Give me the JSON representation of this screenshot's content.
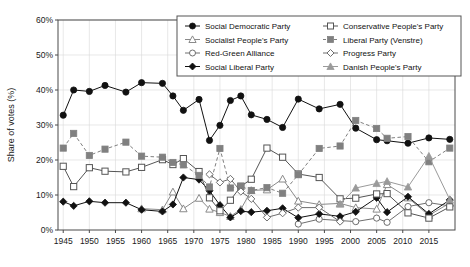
{
  "chart_data": {
    "type": "line",
    "title": "",
    "xlabel": "",
    "ylabel": "Share of votes (%)",
    "xlim": [
      1944,
      2020
    ],
    "ylim": [
      0,
      60
    ],
    "ytick_labels": [
      "0%",
      "10%",
      "20%",
      "30%",
      "40%",
      "50%",
      "60%"
    ],
    "ytick_values": [
      0,
      10,
      20,
      30,
      40,
      50,
      60
    ],
    "xtick_labels": [
      "1945",
      "1950",
      "1955",
      "1960",
      "1965",
      "1970",
      "1975",
      "1980",
      "1985",
      "1990",
      "1995",
      "2000",
      "2005",
      "2010",
      "2015"
    ],
    "xtick_values": [
      1945,
      1950,
      1955,
      1960,
      1965,
      1970,
      1975,
      1980,
      1985,
      1990,
      1995,
      2000,
      2005,
      2010,
      2015
    ],
    "grid": true,
    "legend_position": "top-right",
    "election_years": [
      1945,
      1947,
      1950,
      1953,
      1957,
      1960,
      1964,
      1966,
      1968,
      1971,
      1973,
      1975,
      1977,
      1979,
      1981,
      1984,
      1987,
      1990,
      1994,
      1998,
      2001,
      2005,
      2007,
      2011,
      2015,
      2019
    ],
    "series": [
      {
        "name": "Social Democratic Party",
        "marker": "filled-circle",
        "color": "#111111",
        "linestyle": "solid",
        "x": [
          1945,
          1947,
          1950,
          1953,
          1957,
          1960,
          1964,
          1966,
          1968,
          1971,
          1973,
          1975,
          1977,
          1979,
          1981,
          1984,
          1987,
          1990,
          1994,
          1998,
          2001,
          2005,
          2007,
          2011,
          2015,
          2019
        ],
        "values": [
          32.8,
          40.0,
          39.6,
          41.3,
          39.4,
          42.1,
          41.9,
          38.3,
          34.2,
          37.3,
          25.6,
          29.9,
          37.0,
          38.3,
          32.9,
          31.6,
          29.3,
          37.4,
          34.6,
          35.9,
          29.1,
          25.8,
          25.5,
          24.8,
          26.3,
          25.9
        ]
      },
      {
        "name": "Socialist People's Party",
        "marker": "open-triangle",
        "color": "#8a8a8a",
        "linestyle": "solid",
        "x": [
          1960,
          1964,
          1966,
          1968,
          1971,
          1973,
          1975,
          1977,
          1979,
          1981,
          1984,
          1987,
          1990,
          1994,
          1998,
          2001,
          2005,
          2007,
          2011,
          2015,
          2019
        ],
        "values": [
          6.1,
          5.8,
          10.9,
          6.1,
          9.1,
          6.0,
          5.0,
          3.9,
          5.9,
          11.3,
          11.5,
          14.6,
          8.3,
          7.3,
          7.6,
          6.4,
          6.0,
          13.0,
          9.2,
          4.2,
          7.7
        ]
      },
      {
        "name": "Red-Green Alliance",
        "marker": "open-circle",
        "color": "#6e6e6e",
        "linestyle": "solid",
        "x": [
          1990,
          1994,
          1998,
          2001,
          2005,
          2007,
          2011,
          2015,
          2019
        ],
        "values": [
          1.7,
          3.1,
          2.7,
          2.4,
          3.4,
          2.2,
          6.7,
          7.8,
          6.9
        ]
      },
      {
        "name": "Social Liberal Party",
        "marker": "filled-diamond",
        "color": "#111111",
        "linestyle": "solid",
        "x": [
          1945,
          1947,
          1950,
          1953,
          1957,
          1960,
          1964,
          1966,
          1968,
          1971,
          1973,
          1975,
          1977,
          1979,
          1981,
          1984,
          1987,
          1990,
          1994,
          1998,
          2001,
          2005,
          2007,
          2011,
          2015,
          2019
        ],
        "values": [
          8.1,
          6.9,
          8.2,
          7.8,
          7.8,
          5.8,
          5.3,
          7.3,
          15.0,
          14.4,
          11.2,
          7.1,
          3.6,
          5.4,
          5.1,
          5.5,
          6.2,
          3.5,
          4.6,
          3.9,
          5.2,
          9.2,
          5.1,
          9.5,
          4.6,
          8.6
        ]
      },
      {
        "name": "Conservative People's Party",
        "marker": "open-square",
        "color": "#555555",
        "linestyle": "solid",
        "x": [
          1945,
          1947,
          1950,
          1953,
          1957,
          1960,
          1964,
          1966,
          1968,
          1971,
          1973,
          1975,
          1977,
          1979,
          1981,
          1984,
          1987,
          1990,
          1994,
          1998,
          2001,
          2005,
          2007,
          2011,
          2015,
          2019
        ],
        "values": [
          18.2,
          12.4,
          17.8,
          16.8,
          16.6,
          17.9,
          20.1,
          18.7,
          20.4,
          16.7,
          9.2,
          5.5,
          8.5,
          12.5,
          14.5,
          23.4,
          20.8,
          16.0,
          15.0,
          8.9,
          9.1,
          10.3,
          10.4,
          4.9,
          3.4,
          6.6
        ]
      },
      {
        "name": "Liberal Party (Venstre)",
        "marker": "filled-square",
        "color": "#808080",
        "linestyle": "dashed",
        "x": [
          1945,
          1947,
          1950,
          1953,
          1957,
          1960,
          1964,
          1966,
          1968,
          1971,
          1973,
          1975,
          1977,
          1979,
          1981,
          1984,
          1987,
          1990,
          1994,
          1998,
          2001,
          2005,
          2007,
          2011,
          2015,
          2019
        ],
        "values": [
          23.4,
          27.6,
          21.3,
          23.1,
          25.1,
          21.1,
          20.8,
          19.3,
          18.6,
          15.6,
          12.3,
          23.3,
          12.0,
          12.5,
          11.3,
          12.1,
          10.5,
          15.8,
          23.3,
          24.0,
          31.3,
          29.0,
          26.2,
          26.7,
          19.5,
          23.4
        ]
      },
      {
        "name": "Progress Party",
        "marker": "open-diamond",
        "color": "#6e6e6e",
        "linestyle": "solid",
        "x": [
          1973,
          1975,
          1977,
          1979,
          1981,
          1984,
          1987,
          1990,
          1994,
          1998
        ],
        "values": [
          15.9,
          13.6,
          14.6,
          11.0,
          8.9,
          3.6,
          4.8,
          6.4,
          6.4,
          2.4
        ]
      },
      {
        "name": "Danish People's Party",
        "marker": "filled-triangle",
        "color": "#9a9a9a",
        "linestyle": "solid",
        "x": [
          1998,
          2001,
          2005,
          2007,
          2011,
          2015,
          2019
        ],
        "values": [
          7.4,
          12.0,
          13.3,
          13.9,
          12.3,
          21.1,
          8.7
        ]
      }
    ]
  }
}
